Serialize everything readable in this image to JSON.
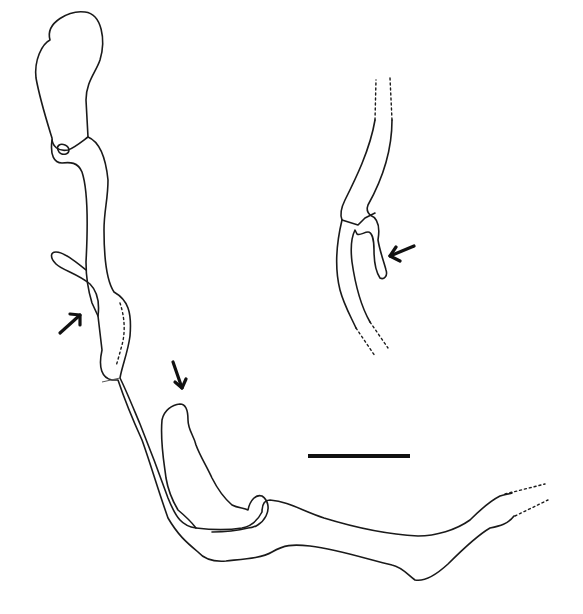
{
  "figure": {
    "type": "scientific-line-drawing",
    "background": "#ffffff",
    "stroke_color": "#1a1a1a",
    "labels": [],
    "main_structure": {
      "description": "Elongated tubular structure with bulbous terminal sac at top-left, curving down and right to dashed-ended tube at bottom-right, with two lateral diverticula",
      "paths": {
        "bulb": "M 50 40 C 45 22 70 10 85 12 C 102 14 106 40 100 60 C 96 72 86 82 86 100 L 88 137 C 80 143 74 148 68 150 C 58 152 52 146 52 138 C 48 125 40 100 36 78 C 34 60 42 44 50 40 Z",
        "nodule": "M 58 150 C 56 146 60 143 65 145 C 70 147 70 153 66 154 C 62 155 59 153 58 150 Z",
        "tube_left": "M 52 140 C 50 155 54 163 62 163 C 70 162 78 162 82 172 C 88 190 88 225 86 262 C 86 275 88 290 92 303 L 98 316 L 102 350 C 98 368 102 378 112 380 L 118 380 C 124 398 132 418 142 440 C 150 462 158 490 168 518 C 178 535 186 542 198 552 C 205 560 214 562 226 561 C 244 559 262 558 272 552 C 284 545 292 544 310 546 C 340 550 370 560 392 565 C 402 567 408 575 415 580 C 425 582 436 575 448 564 C 462 550 478 535 490 528 C 500 526 508 524 514 516",
        "tube_right": "M 88 137 C 100 142 106 160 108 180 C 108 200 104 210 104 230 C 104 258 106 280 114 292 C 128 300 132 312 130 336 C 128 352 122 366 120 378 C 126 390 132 405 140 424 C 148 444 158 470 168 498 C 176 518 182 526 196 528 C 212 530 230 530 242 528 C 252 526 258 520 262 512 C 262 505 264 500 270 500 C 290 502 300 510 324 518 C 350 526 380 534 418 536 C 436 536 456 530 470 520 C 480 510 492 500 500 496 C 506 494 510 494 512 493",
        "diverticulum_left": "M 98 316 C 100 300 96 290 90 284 C 78 274 62 270 56 264 C 50 258 50 252 56 252 C 64 252 76 262 86 270",
        "diverticulum_left_dashed": "M 120 303 C 124 315 126 330 122 345 C 120 352 118 360 116 366",
        "diverticulum_right": "M 196 528 C 190 520 184 515 178 510 C 172 500 168 490 166 478 C 164 462 160 442 162 420 C 164 410 172 405 180 404 C 186 404 188 410 188 420 C 188 430 194 436 196 445 C 200 456 206 465 212 478 C 218 490 224 498 232 505 C 238 508 244 508 248 510 C 250 500 256 494 262 496 C 268 500 270 508 266 516 C 262 524 254 528 248 528 C 240 530 226 532 212 532",
        "constriction": "M 102 382 L 120 378",
        "tube_end_dashed_upper": "M 505 494 L 545 484",
        "tube_end_dashed_lower": "M 515 516 L 548 500"
      }
    },
    "inset_structure": {
      "description": "Detail of a tube segment with a small lateral diverticulum, dashed tube ends above and below",
      "paths": {
        "left_wall_upper": "M 375 120 C 370 150 355 180 345 200 C 340 210 340 215 342 220",
        "right_wall_upper": "M 392 120 C 392 150 382 180 368 205 C 366 210 368 213 370 215",
        "collar": "M 342 220 L 358 225 L 365 218 L 375 213",
        "diverticulum": "M 370 215 C 378 218 380 228 378 240 C 380 252 384 262 386 270 C 388 276 384 280 380 278 C 376 272 374 262 374 250 C 374 240 372 232 368 232 C 364 232 360 236 357 234 L 355 230 C 352 236 350 245 352 262 C 356 290 362 308 370 322",
        "left_wall_lower": "M 342 220 C 336 245 335 270 340 290 C 344 305 350 315 356 328",
        "dashed_top_left": "M 375 120 L 376 80",
        "dashed_top_right": "M 392 120 L 390 78",
        "dashed_bottom_left": "M 356 328 L 375 356",
        "dashed_bottom_right": "M 370 322 L 388 348"
      }
    },
    "arrows": [
      {
        "name": "arrow-left-diverticulum",
        "from": [
          60,
          333
        ],
        "to": [
          80,
          315
        ],
        "direction": "up-right"
      },
      {
        "name": "arrow-right-diverticulum",
        "from": [
          172,
          362
        ],
        "to": [
          182,
          388
        ],
        "direction": "down"
      },
      {
        "name": "arrow-inset-diverticulum",
        "from": [
          414,
          246
        ],
        "to": [
          390,
          256
        ],
        "direction": "left"
      }
    ],
    "scale_bar": {
      "x1": 308,
      "x2": 410,
      "y": 456,
      "length_label": ""
    }
  }
}
